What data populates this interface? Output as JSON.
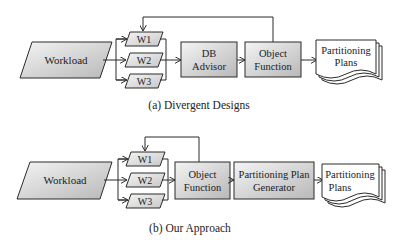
{
  "colors": {
    "fill_gradient_light": "#f2f2f2",
    "fill_gradient_dark": "#bdbdbd",
    "stroke": "#2b2b2b",
    "text": "#222222",
    "background": "#ffffff"
  },
  "diagram_a": {
    "caption": "(a) Divergent Designs",
    "workload": "Workload",
    "workloads": [
      "W1",
      "W2",
      "W3"
    ],
    "advisor": [
      "DB",
      "Advisor"
    ],
    "object_function": [
      "Object",
      "Function"
    ],
    "output": [
      "Partitioning",
      "Plans"
    ]
  },
  "diagram_b": {
    "caption": "(b) Our Approach",
    "workload": "Workload",
    "workloads": [
      "W1",
      "W2",
      "W3"
    ],
    "object_function": [
      "Object",
      "Function"
    ],
    "generator": [
      "Partitioning Plan",
      "Generator"
    ],
    "output": [
      "Partitioning",
      "Plans"
    ]
  }
}
